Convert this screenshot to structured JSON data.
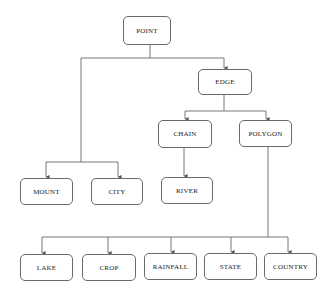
{
  "diagram": {
    "type": "hierarchy",
    "colors": {
      "line": "#6a6a6a",
      "box_border": "#6a6a6a",
      "text": "#222222",
      "background": "#ffffff"
    },
    "nodes": [
      {
        "id": "point",
        "label": "POINT",
        "x": 123,
        "y": 16,
        "w": 48,
        "h": 29
      },
      {
        "id": "edge",
        "label": "EDGE",
        "x": 198,
        "y": 69,
        "w": 54,
        "h": 26
      },
      {
        "id": "chain",
        "label": "CHAIN",
        "x": 158,
        "y": 120,
        "w": 54,
        "h": 28
      },
      {
        "id": "polygon",
        "label": "POLYGON",
        "x": 239,
        "y": 120,
        "w": 53,
        "h": 27
      },
      {
        "id": "mount",
        "label": "MOUNT",
        "x": 20,
        "y": 178,
        "w": 53,
        "h": 27
      },
      {
        "id": "city",
        "label": "CITY",
        "x": 91,
        "y": 178,
        "w": 52,
        "h": 27
      },
      {
        "id": "river",
        "label": "RIVER",
        "x": 161,
        "y": 177,
        "w": 52,
        "h": 27
      },
      {
        "id": "lake",
        "label": "LAKE",
        "x": 20,
        "y": 254,
        "w": 53,
        "h": 27
      },
      {
        "id": "crop",
        "label": "CROP",
        "x": 82,
        "y": 254,
        "w": 54,
        "h": 27
      },
      {
        "id": "rainfall",
        "label": "RAINFALL",
        "x": 144,
        "y": 253,
        "w": 53,
        "h": 27
      },
      {
        "id": "state",
        "label": "STATE",
        "x": 204,
        "y": 253,
        "w": 53,
        "h": 27
      },
      {
        "id": "country",
        "label": "COUNTRY",
        "x": 264,
        "y": 253,
        "w": 53,
        "h": 27
      }
    ],
    "edges": [
      {
        "from": "point",
        "to": "edge"
      },
      {
        "from": "point",
        "to": "mount"
      },
      {
        "from": "point",
        "to": "city"
      },
      {
        "from": "edge",
        "to": "chain"
      },
      {
        "from": "edge",
        "to": "polygon"
      },
      {
        "from": "chain",
        "to": "river"
      },
      {
        "from": "polygon",
        "to": "lake"
      },
      {
        "from": "polygon",
        "to": "crop"
      },
      {
        "from": "polygon",
        "to": "rainfall"
      },
      {
        "from": "polygon",
        "to": "state"
      },
      {
        "from": "polygon",
        "to": "country"
      }
    ]
  }
}
